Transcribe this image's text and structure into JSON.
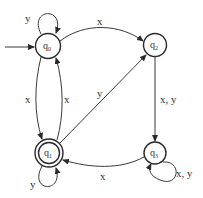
{
  "diagram": {
    "type": "finite-automaton",
    "states": [
      {
        "id": "q0",
        "name": "q",
        "sub": "0",
        "initial": true,
        "accepting": false
      },
      {
        "id": "q1",
        "name": "q",
        "sub": "1",
        "initial": false,
        "accepting": true
      },
      {
        "id": "q2",
        "name": "q",
        "sub": "2",
        "initial": false,
        "accepting": false
      },
      {
        "id": "q3",
        "name": "q",
        "sub": "3",
        "initial": false,
        "accepting": false
      }
    ],
    "transitions": [
      {
        "from": "q0",
        "to": "q0",
        "label": "y"
      },
      {
        "from": "q0",
        "to": "q2",
        "label": "x"
      },
      {
        "from": "q0",
        "to": "q1",
        "label": "x"
      },
      {
        "from": "q1",
        "to": "q0",
        "label": "x"
      },
      {
        "from": "q1",
        "to": "q2",
        "label": "y"
      },
      {
        "from": "q1",
        "to": "q1",
        "label": "y"
      },
      {
        "from": "q2",
        "to": "q3",
        "label": "x, y"
      },
      {
        "from": "q3",
        "to": "q1",
        "label": "x"
      },
      {
        "from": "q3",
        "to": "q3",
        "label": "x, y"
      }
    ],
    "colors": {
      "stroke": "#2a2a2a",
      "text": "#333333",
      "background": "#ffffff"
    }
  }
}
